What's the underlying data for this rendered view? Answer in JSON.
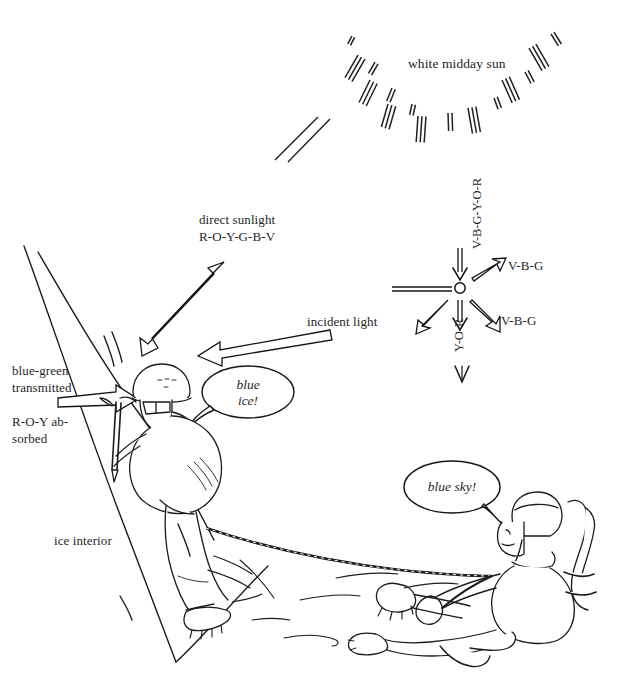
{
  "figure": {
    "title_caption": "",
    "sun_label": "white midday sun",
    "labels": {
      "direct_sunlight": "direct sunlight",
      "direct_sunlight_spectrum": "R-O-Y-G-B-V",
      "incident_light": "incident light",
      "blue_green_transmitted_line1": "blue-green",
      "blue_green_transmitted_line2": "transmitted",
      "absorbed_line1": "R-O-Y ab-",
      "absorbed_line2": "sorbed",
      "ice_interior": "ice interior",
      "scatter_up": "V-B-G-Y-O-R",
      "scatter_right_upper": "V-B-G",
      "scatter_right_lower": "V-B-G",
      "scatter_down_left": "Y-O-R"
    },
    "speech_bubbles": [
      {
        "id": "climber-bubble",
        "line1": "blue",
        "line2": "ice!"
      },
      {
        "id": "belayer-bubble",
        "line1": "blue sky!",
        "line2": ""
      }
    ],
    "colors": {
      "ink": "#1a1a1a",
      "paper": "#ffffff",
      "ray": "#262626"
    }
  }
}
